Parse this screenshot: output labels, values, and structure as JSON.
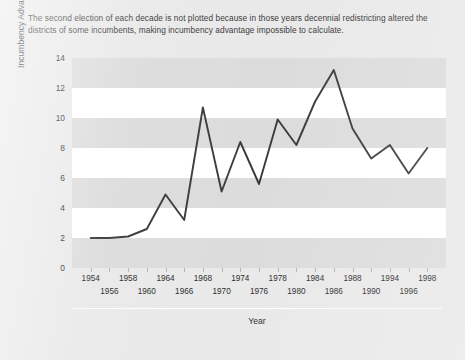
{
  "note": "The second election of each decade is not plotted because in those years decennial redistricting altered the districts of some incumbents, making incumbency advantage impossible to calculate.",
  "axis": {
    "xlabel": "Year",
    "ylabel": "Incumbency Advantage (Vote Percentage)"
  },
  "colors": {
    "line": "#3a3a3a",
    "band": "#dcdcdc",
    "plot_background": "#ffffff",
    "page_background": "#e9e9e9",
    "text": "#2b2b2b"
  },
  "chart_data": {
    "type": "line",
    "title": "",
    "xlabel": "Year",
    "ylabel": "Incumbency Advantage (Vote Percentage)",
    "ylim": [
      0,
      14
    ],
    "yticks": [
      0,
      2,
      4,
      6,
      8,
      10,
      12,
      14
    ],
    "grid": "horizontal-bands",
    "legend": "none",
    "x": [
      1954,
      1956,
      1958,
      1960,
      1964,
      1966,
      1968,
      1970,
      1974,
      1976,
      1978,
      1980,
      1984,
      1986,
      1988,
      1990,
      1994,
      1996,
      1998
    ],
    "xtick_labels_row1": [
      "1954",
      "1958",
      "1964",
      "1968",
      "1974",
      "1978",
      "1984",
      "1988",
      "1994",
      "1998"
    ],
    "xtick_labels_row2": [
      "1956",
      "1960",
      "1966",
      "1970",
      "1976",
      "1980",
      "1986",
      "1990",
      "1996"
    ],
    "values": [
      2.0,
      2.0,
      2.1,
      2.6,
      4.9,
      3.2,
      10.7,
      5.1,
      8.4,
      5.6,
      9.9,
      8.2,
      11.1,
      13.2,
      9.3,
      7.3,
      8.2,
      6.3,
      8.0
    ],
    "series": [
      {
        "name": "Incumbency advantage",
        "values": [
          2.0,
          2.0,
          2.1,
          2.6,
          4.9,
          3.2,
          10.7,
          5.1,
          8.4,
          5.6,
          9.9,
          8.2,
          11.1,
          13.2,
          9.3,
          7.3,
          8.2,
          6.3,
          8.0
        ]
      }
    ]
  }
}
